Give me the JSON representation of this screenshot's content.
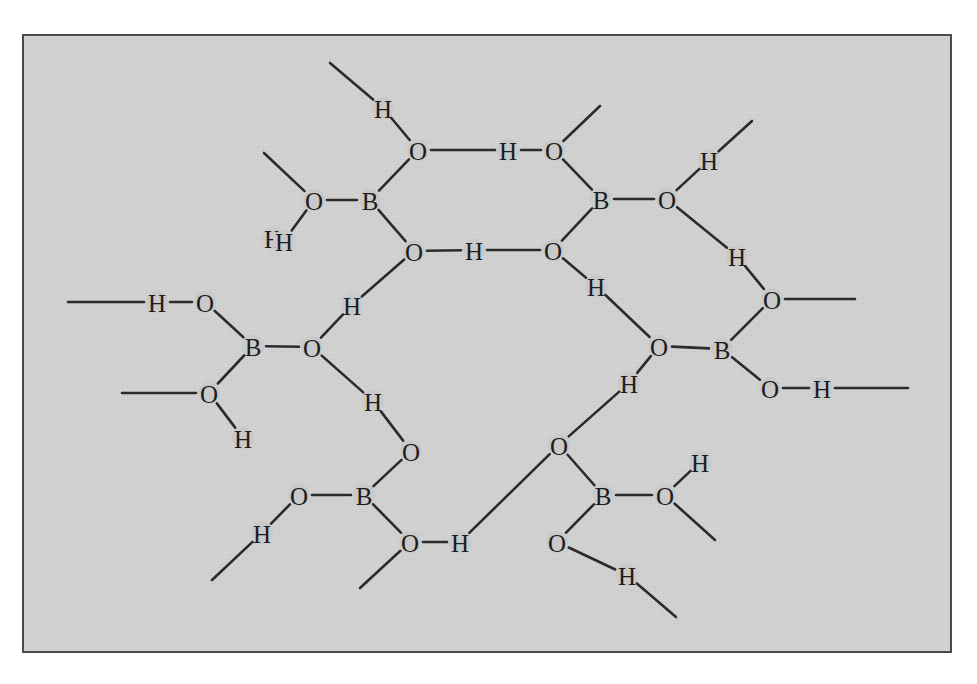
{
  "figure": {
    "kind": "chemical-structure-diagram",
    "background_color": "#c9c9c9",
    "page_color": "#ffffff",
    "stroke_color": "#2b2b2b",
    "label_color": "#1d1d1d",
    "frame": {
      "x": 22,
      "y": 34,
      "width": 930,
      "height": 619,
      "border_color": "#4a4a4a",
      "border_width": 2
    },
    "canvas": {
      "width": 977,
      "height": 684
    }
  },
  "chart_data": {
    "type": "diagram",
    "structure": "hexagonal ring of six B(OH)3 units joined by O-H...O hydrogen bonds",
    "element_labels": [
      "B",
      "O",
      "H"
    ],
    "boron_count": 6,
    "oxygen_count": 18,
    "hydrogen_count": 18,
    "ring_members": 12,
    "atoms": [
      {
        "id": "B1",
        "label": "B",
        "x": 370,
        "y": 200
      },
      {
        "id": "B2",
        "label": "B",
        "x": 601,
        "y": 199
      },
      {
        "id": "B3",
        "label": "B",
        "x": 722,
        "y": 349
      },
      {
        "id": "B4",
        "label": "B",
        "x": 603,
        "y": 495
      },
      {
        "id": "B5",
        "label": "B",
        "x": 364,
        "y": 495
      },
      {
        "id": "B6",
        "label": "B",
        "x": 253,
        "y": 346
      },
      {
        "id": "O1a",
        "label": "O",
        "x": 418,
        "y": 150
      },
      {
        "id": "O1b",
        "label": "O",
        "x": 314,
        "y": 200
      },
      {
        "id": "O1c",
        "label": "O",
        "x": 414,
        "y": 251
      },
      {
        "id": "O2a",
        "label": "O",
        "x": 554,
        "y": 150
      },
      {
        "id": "O2b",
        "label": "O",
        "x": 667,
        "y": 199
      },
      {
        "id": "O2c",
        "label": "O",
        "x": 553,
        "y": 250
      },
      {
        "id": "O3a",
        "label": "O",
        "x": 772,
        "y": 299
      },
      {
        "id": "O3b",
        "label": "O",
        "x": 659,
        "y": 346
      },
      {
        "id": "O3c",
        "label": "O",
        "x": 770,
        "y": 388
      },
      {
        "id": "O4a",
        "label": "O",
        "x": 557,
        "y": 542
      },
      {
        "id": "O4b",
        "label": "O",
        "x": 665,
        "y": 495
      },
      {
        "id": "O4c",
        "label": "O",
        "x": 559,
        "y": 445
      },
      {
        "id": "O5a",
        "label": "O",
        "x": 410,
        "y": 542
      },
      {
        "id": "O5b",
        "label": "O",
        "x": 299,
        "y": 495
      },
      {
        "id": "O5c",
        "label": "O",
        "x": 411,
        "y": 451
      },
      {
        "id": "O6a",
        "label": "O",
        "x": 205,
        "y": 302
      },
      {
        "id": "O6b",
        "label": "O",
        "x": 312,
        "y": 347
      },
      {
        "id": "O6c",
        "label": "O",
        "x": 209,
        "y": 393
      },
      {
        "id": "H1a",
        "label": "H",
        "x": 383,
        "y": 108
      },
      {
        "id": "H1b",
        "label": "H",
        "x": 273,
        "y": 238
      },
      {
        "id": "H1c",
        "label": "H",
        "x": 352,
        "y": 305
      },
      {
        "id": "H2a",
        "label": "H",
        "x": 508,
        "y": 150
      },
      {
        "id": "H2b",
        "label": "H",
        "x": 709,
        "y": 160
      },
      {
        "id": "H2c",
        "label": "H",
        "x": 474,
        "y": 250
      },
      {
        "id": "H3a",
        "label": "H",
        "x": 737,
        "y": 256
      },
      {
        "id": "H3b",
        "label": "H",
        "x": 596,
        "y": 286
      },
      {
        "id": "H3c",
        "label": "H",
        "x": 822,
        "y": 388
      },
      {
        "id": "H4a",
        "label": "H",
        "x": 700,
        "y": 462
      },
      {
        "id": "H4b",
        "label": "H",
        "x": 627,
        "y": 575
      },
      {
        "id": "H4c",
        "label": "H",
        "x": 629,
        "y": 383
      },
      {
        "id": "H5a",
        "label": "H",
        "x": 460,
        "y": 542
      },
      {
        "id": "H5b",
        "label": "H",
        "x": 262,
        "y": 533
      },
      {
        "id": "H5c",
        "label": "H",
        "x": 373,
        "y": 401
      },
      {
        "id": "H6a",
        "label": "H",
        "x": 157,
        "y": 302
      },
      {
        "id": "H6b",
        "label": "H",
        "x": 243,
        "y": 438
      },
      {
        "id": "H6c",
        "label": "H",
        "x": 284,
        "y": 241
      }
    ],
    "bonds": [
      {
        "from": "B1",
        "to": "O1a"
      },
      {
        "from": "B1",
        "to": "O1b"
      },
      {
        "from": "B1",
        "to": "O1c"
      },
      {
        "from": "B2",
        "to": "O2a"
      },
      {
        "from": "B2",
        "to": "O2b"
      },
      {
        "from": "B2",
        "to": "O2c"
      },
      {
        "from": "B3",
        "to": "O3a"
      },
      {
        "from": "B3",
        "to": "O3b"
      },
      {
        "from": "B3",
        "to": "O3c"
      },
      {
        "from": "B4",
        "to": "O4a"
      },
      {
        "from": "B4",
        "to": "O4b"
      },
      {
        "from": "B4",
        "to": "O4c"
      },
      {
        "from": "B5",
        "to": "O5a"
      },
      {
        "from": "B5",
        "to": "O5b"
      },
      {
        "from": "B5",
        "to": "O5c"
      },
      {
        "from": "B6",
        "to": "O6a"
      },
      {
        "from": "B6",
        "to": "O6b"
      },
      {
        "from": "B6",
        "to": "O6c"
      },
      {
        "from": "O1a",
        "to": "H2a"
      },
      {
        "from": "H2a",
        "to": "O2a"
      },
      {
        "from": "O1c",
        "to": "H2c"
      },
      {
        "from": "H2c",
        "to": "O2c"
      },
      {
        "from": "O2c",
        "to": "H3b"
      },
      {
        "from": "H3b",
        "to": "O3b"
      },
      {
        "from": "O3b",
        "to": "H4c"
      },
      {
        "from": "H4c",
        "to": "O4c"
      },
      {
        "from": "O4c",
        "to": "H5a"
      },
      {
        "from": "H5a",
        "to": "O5a"
      },
      {
        "from": "O5a",
        "to": "H5a"
      },
      {
        "from": "O5c",
        "to": "H5c"
      },
      {
        "from": "H5c",
        "to": "O6b"
      },
      {
        "from": "O6b",
        "to": "H1c"
      },
      {
        "from": "H1c",
        "to": "O1c"
      },
      {
        "from": "O1a",
        "to": "H1a"
      },
      {
        "from": "O1b",
        "to": "H6c"
      },
      {
        "from": "O2b",
        "to": "H2b"
      },
      {
        "from": "O2b",
        "to": "H3a"
      },
      {
        "from": "H3a",
        "to": "O3a"
      },
      {
        "from": "O3c",
        "to": "H3c"
      },
      {
        "from": "O4b",
        "to": "H4a"
      },
      {
        "from": "O4a",
        "to": "H4b"
      },
      {
        "from": "O5b",
        "to": "H5b"
      },
      {
        "from": "O6a",
        "to": "H6a"
      },
      {
        "from": "O6c",
        "to": "H6b"
      }
    ],
    "dangling_bonds": [
      {
        "from_atom": "H1a",
        "to_x": 330,
        "to_y": 63
      },
      {
        "from_atom": "O1b",
        "to_x": 264,
        "to_y": 153
      },
      {
        "from_atom": "O2a",
        "to_x": 600,
        "to_y": 106
      },
      {
        "from_atom": "H2b",
        "to_x": 752,
        "to_y": 121
      },
      {
        "from_atom": "O3a",
        "to_x": 855,
        "to_y": 299
      },
      {
        "from_atom": "H3c",
        "to_x": 908,
        "to_y": 388
      },
      {
        "from_atom": "O4b",
        "to_x": 715,
        "to_y": 540
      },
      {
        "from_atom": "H4b",
        "to_x": 676,
        "to_y": 617
      },
      {
        "from_atom": "O5a",
        "to_x": 360,
        "to_y": 588
      },
      {
        "from_atom": "H5b",
        "to_x": 212,
        "to_y": 580
      },
      {
        "from_atom": "O6c",
        "to_x": 122,
        "to_y": 393
      },
      {
        "from_atom": "H6a",
        "to_x": 68,
        "to_y": 302
      }
    ]
  }
}
